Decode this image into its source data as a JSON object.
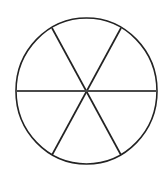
{
  "figure": {
    "title": "Circle divided into six equal sectors",
    "canvas": {
      "width": 164,
      "height": 170,
      "background_color": "#ffffff"
    },
    "circle": {
      "name": "circle-outline",
      "center_x": 86.5,
      "center_y": 91,
      "radius_x": 70.5,
      "radius_y": 73,
      "left_edge_x": 16,
      "right_edge_x": 157,
      "top_edge_y": 18,
      "bottom_edge_y": 164,
      "stroke_color": "#232323",
      "stroke_width": 1.6,
      "fill_color": "#ffffff"
    },
    "dividers": [
      {
        "name": "horizontal-diameter",
        "label": "Horizontal diameter",
        "angle_degrees": 0,
        "x1": 16,
        "y1": 91,
        "x2": 157,
        "y2": 91,
        "stroke_color": "#4a4a4a",
        "stroke_width": 2.0
      },
      {
        "name": "diagonal-diameter-upper-left-to-lower-right",
        "label": "Diagonal diameter (60 degrees)",
        "angle_degrees": 60,
        "x1": 52,
        "y1": 28,
        "x2": 121,
        "y2": 155,
        "stroke_color": "#232323",
        "stroke_width": 1.7
      },
      {
        "name": "diagonal-diameter-upper-right-to-lower-left",
        "label": "Diagonal diameter (120 degrees)",
        "angle_degrees": 120,
        "x1": 121,
        "y1": 28,
        "x2": 52,
        "y2": 155,
        "stroke_color": "#232323",
        "stroke_width": 1.7
      }
    ],
    "center_point": {
      "name": "center-intersection",
      "x": 86.5,
      "y": 91
    },
    "sector_count": 6,
    "sector_angle_degrees": 60
  },
  "chart_data": {
    "type": "pie",
    "title": "Circle divided into six equal sectors",
    "categories": [
      "Sector 1",
      "Sector 2",
      "Sector 3",
      "Sector 4",
      "Sector 5",
      "Sector 6"
    ],
    "values": [
      60,
      60,
      60,
      60,
      60,
      60
    ],
    "value_unit": "degrees",
    "percentages": [
      16.67,
      16.67,
      16.67,
      16.67,
      16.67,
      16.67
    ],
    "slice_fill_color": "#ffffff",
    "slice_stroke_color": "#232323",
    "labels_shown": false,
    "legend_shown": false,
    "grid": false
  }
}
